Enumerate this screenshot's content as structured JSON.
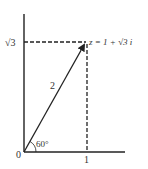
{
  "diagram": {
    "type": "complex-plane-vector",
    "point_label": "z = 1 + √3 i",
    "y_tick_label": "√3",
    "x_tick_label": "1",
    "origin_label": "0",
    "magnitude_label": "2",
    "angle_label": "60°",
    "colors": {
      "line": "#222222",
      "text": "#333333",
      "background": "#ffffff"
    }
  }
}
